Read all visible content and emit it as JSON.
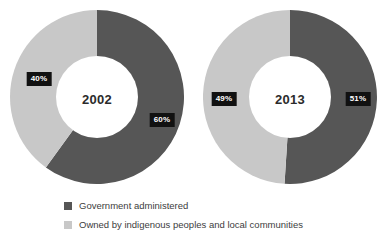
{
  "colors": {
    "government": "#565656",
    "indigenous": "#c8c8c8",
    "badge_background": "#111111",
    "badge_text": "#ffffff",
    "center_text": "#2b2b2b",
    "legend_text": "#3d3d3d",
    "background": "#ffffff"
  },
  "legend": {
    "items": [
      {
        "label": "Government administered",
        "color": "#565656",
        "swatch_name": "legend-swatch-government"
      },
      {
        "label": "Owned by indigenous peoples and local communities",
        "color": "#c8c8c8",
        "swatch_name": "legend-swatch-indigenous"
      }
    ]
  },
  "charts": [
    {
      "year": "2002",
      "labels": {
        "government": "60%",
        "indigenous": "40%"
      }
    },
    {
      "year": "2013",
      "labels": {
        "government": "51%",
        "indigenous": "49%"
      }
    }
  ],
  "chart_data": {
    "type": "pie",
    "variant": "donut",
    "title": "",
    "subtitle": "",
    "xlabel": "",
    "ylabel": "",
    "grid": false,
    "legend_position": "bottom-left",
    "units": "percent",
    "categories": [
      "Government administered",
      "Owned by indigenous peoples and local communities"
    ],
    "series": [
      {
        "name": "2002",
        "values": [
          60,
          40
        ],
        "labels": [
          "60%",
          "40%"
        ],
        "center_label": "2002",
        "start_angle_deg": 0,
        "direction": "clockwise"
      },
      {
        "name": "2013",
        "values": [
          51,
          49
        ],
        "labels": [
          "51%",
          "49%"
        ],
        "center_label": "2013",
        "start_angle_deg": 0,
        "direction": "clockwise"
      }
    ],
    "annotations": [
      "2002",
      "2013",
      "60%",
      "40%",
      "51%",
      "49%"
    ]
  }
}
